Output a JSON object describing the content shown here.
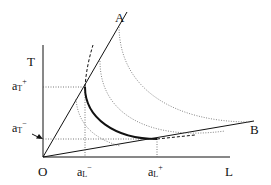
{
  "diagram": {
    "axes": {
      "y_label": "T",
      "x_label": "L",
      "origin_label": "O"
    },
    "rays": [
      {
        "label": "A"
      },
      {
        "label": "B"
      }
    ],
    "ticks": {
      "aT_plus": {
        "base": "a",
        "sub": "T",
        "sup": "+"
      },
      "aT_minus": {
        "base": "a",
        "sub": "T",
        "sup": "−"
      },
      "aL_minus": {
        "base": "a",
        "sub": "L",
        "sup": "−"
      },
      "aL_plus": {
        "base": "a",
        "sub": "L",
        "sup": "+"
      }
    },
    "colors": {
      "line": "#111111",
      "dotted": "#666666"
    }
  }
}
